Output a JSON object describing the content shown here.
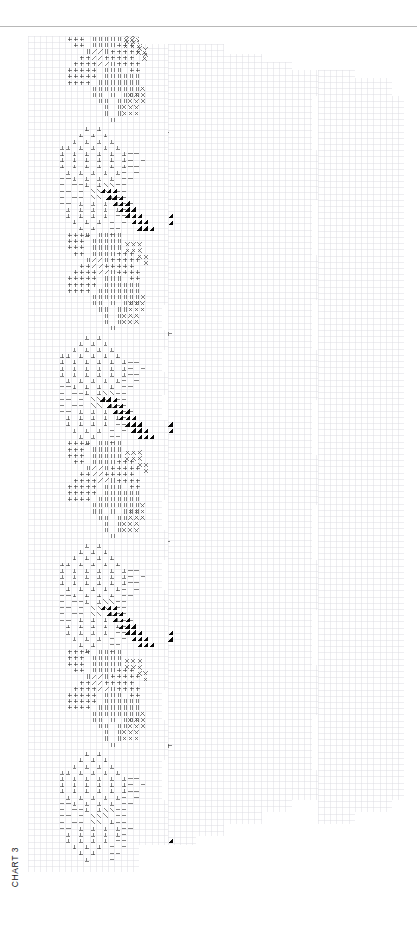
{
  "document": {
    "title": "CHART 3",
    "kind": "knitting-stitch-chart",
    "width": 417,
    "height": 942,
    "background": "#ffffff",
    "rule_color": "#b8b8b8",
    "grid_color": "#d9d9e0",
    "outline_color": "#4a4a4a",
    "symbol_color": "#2b2b2b",
    "solid_color": "#0a0a0a"
  },
  "legend_symbols": [
    {
      "id": "plus",
      "glyph": "+",
      "name": "plus-stitch"
    },
    {
      "id": "double-bar",
      "glyph": "‖",
      "name": "double-bar-stitch"
    },
    {
      "id": "slash",
      "glyph": "/",
      "name": "right-slant-decrease"
    },
    {
      "id": "backslash",
      "glyph": "\\",
      "name": "left-slant-decrease"
    },
    {
      "id": "ex",
      "glyph": "×",
      "name": "cross-stitch"
    },
    {
      "id": "up-tack",
      "glyph": "⊥",
      "name": "purl-tack-stitch"
    },
    {
      "id": "dash",
      "glyph": "—",
      "name": "dash-stitch"
    },
    {
      "id": "check",
      "glyph": "↘",
      "name": "check-stitch"
    },
    {
      "id": "turnstile",
      "glyph": "⊢",
      "name": "turnstile-stitch"
    },
    {
      "id": "letter-n",
      "glyph": "N",
      "name": "letter-n-stitch"
    },
    {
      "id": "letter-l",
      "glyph": "L",
      "name": "letter-l-stitch"
    },
    {
      "id": "tri-dr",
      "glyph": "◢",
      "name": "filled-triangle-down-right"
    },
    {
      "id": "tri-left",
      "glyph": "◀",
      "name": "filled-triangle-left"
    },
    {
      "id": "tri-right",
      "glyph": "▶",
      "name": "filled-triangle-right"
    },
    {
      "id": "square",
      "glyph": "■",
      "name": "filled-square-stitch"
    }
  ],
  "grid": {
    "cell": 6.2,
    "origin_x": 28,
    "origin_y": 36
  },
  "panels": [
    {
      "name": "panel-left",
      "outline": "28,36 139,36 139,44 168,44 168,95 175,95 175,140 168,140 168,305 162,305 162,330 168,330 168,350 162,350 162,372 168,372 168,395 162,395 162,420 168,420 168,450 175,450 175,470 168,470 168,500 162,500 162,530 168,530 168,560 162,560 162,590 168,590 168,620 175,620 175,650 168,650 168,690 162,690 162,720 168,720 168,760 162,760 162,800 168,800 168,845 139,845 139,872 28,872"
    },
    {
      "name": "panel-middle",
      "outline": "168,44 224,44 224,54 262,54 262,62 292,62 292,70 318,70 318,96 312,96 312,150 318,150 318,200 312,200 312,255 318,255 318,300 312,300 312,350 318,350 318,400 312,400 312,455 318,455 318,505 312,505 312,560 318,560 318,610 312,610 312,665 318,665 318,715 312,715 312,770 318,770 318,800 292,800 292,812 262,812 262,824 224,824 224,836 196,836 196,845 168,845"
    },
    {
      "name": "panel-right",
      "outline": "318,70 355,70 355,78 392,78 392,96 404,96 404,800 392,800 392,812 355,812 355,824 318,824"
    }
  ],
  "motifs": {
    "left_panel": {
      "description": "Diamond motifs of plus and double-bar stitches, tack/dash leaf motifs, diagonal slash cables, X cross clusters and diagonal bands of filled triangles.",
      "repeat_rows": 4
    },
    "middle_panel": {
      "description": "Large check-stitch diamonds with a black triangle accent, turnstile stitch fields with filled right-triangle accents, diagonal bands of filled triangles along the right edge.",
      "repeat_rows": 4
    },
    "right_panel": {
      "description": "Blocks of letter-N and letter-L stitches, triangular fields of filled left triangles, and solid black square blocks.",
      "repeat_rows": 4
    }
  }
}
